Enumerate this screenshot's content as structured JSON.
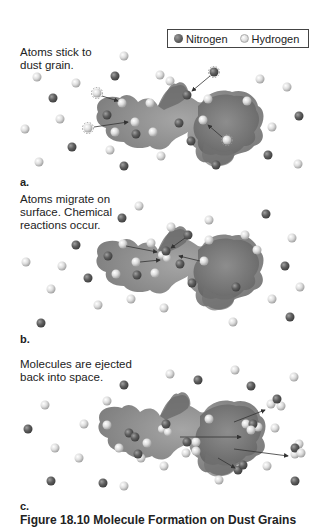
{
  "legend": {
    "nitrogen_label": "Nitrogen",
    "hydrogen_label": "Hydrogen",
    "nitrogen_color": "#5e5e5e",
    "hydrogen_color": "#dcdcdc"
  },
  "panels": [
    {
      "label": "a.",
      "caption_line1": "Atoms stick to",
      "caption_line2": "dust grain."
    },
    {
      "label": "b.",
      "caption_line1": "Atoms migrate on",
      "caption_line2": "surface. Chemical",
      "caption_line3": "reactions occur."
    },
    {
      "label": "c.",
      "caption_line1": "Molecules are ejected",
      "caption_line2": "back into space."
    }
  ],
  "figure_caption": "Figure 18.10 Molecule Formation on Dust Grains",
  "colors": {
    "dust_grain_light": "#9a9a9a",
    "dust_grain_dark": "#6e6e6e",
    "arrow": "#333333"
  }
}
